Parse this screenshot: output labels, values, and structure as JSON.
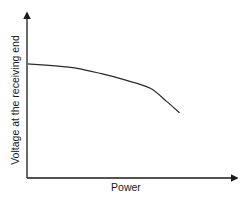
{
  "chart_data": {
    "type": "line",
    "title": "",
    "xlabel": "Power",
    "ylabel": "Voltage at the receiving end",
    "grid": false,
    "legend": null,
    "ticks": {
      "x": [],
      "y": []
    },
    "axis_ranges": {
      "x": [
        0,
        1
      ],
      "y": [
        0,
        1
      ]
    },
    "series": [
      {
        "name": "Receiving-end voltage vs power",
        "description": "Voltage starts high and roughly flat, then droops increasingly steeply as power rises",
        "x": [
          0.0,
          0.25,
          0.45,
          0.6,
          0.75,
          0.85,
          0.93
        ],
        "y": [
          0.7,
          0.68,
          0.64,
          0.6,
          0.55,
          0.47,
          0.4
        ]
      }
    ]
  },
  "colors": {
    "axis": "#1a1a1a",
    "curve": "#2a2a2a",
    "background": "#ffffff"
  }
}
